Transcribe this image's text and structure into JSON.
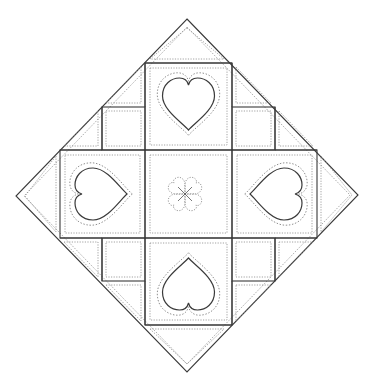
{
  "figure": {
    "cropped_text_fragment": "",
    "colors": {
      "background": "#ffffff",
      "seam_line": "#3a3a3a",
      "stitch_line": "#8a8a8a"
    },
    "diamond": {
      "top": [
        187,
        19
      ],
      "right": [
        358,
        195
      ],
      "bottom": [
        187,
        372
      ],
      "left": [
        16,
        196
      ]
    },
    "grid": {
      "x_lines": [
        60,
        102,
        145,
        232,
        275,
        317
      ],
      "y_lines": [
        63,
        107,
        150,
        238,
        281,
        325
      ]
    },
    "blocks": {
      "center": {
        "label": "clover-block",
        "motif": "four-heart clover",
        "bounds": [
          145,
          150,
          232,
          238
        ]
      },
      "hearts": [
        {
          "label": "top-heart-block",
          "points": "down",
          "bounds": [
            145,
            63,
            232,
            150
          ]
        },
        {
          "label": "left-heart-block",
          "points": "right",
          "bounds": [
            60,
            150,
            145,
            238
          ]
        },
        {
          "label": "right-heart-block",
          "points": "left",
          "bounds": [
            232,
            150,
            317,
            238
          ]
        },
        {
          "label": "bottom-heart-block",
          "points": "up",
          "bounds": [
            145,
            238,
            232,
            325
          ]
        }
      ],
      "small_squares": [
        {
          "label": "upper-left-square",
          "bounds": [
            102,
            107,
            145,
            150
          ]
        },
        {
          "label": "upper-right-square",
          "bounds": [
            232,
            107,
            275,
            150
          ]
        },
        {
          "label": "lower-left-square",
          "bounds": [
            102,
            238,
            145,
            281
          ]
        },
        {
          "label": "lower-right-square",
          "bounds": [
            232,
            238,
            275,
            281
          ]
        }
      ],
      "setting_triangles_count": 12
    }
  }
}
